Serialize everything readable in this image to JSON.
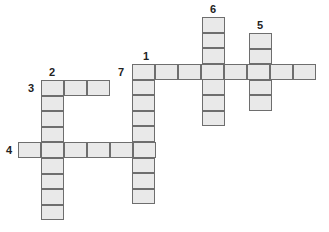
{
  "puzzle": {
    "type": "crossword",
    "cell_fill": "#e9e9e9",
    "cell_border": "#6e6e6e",
    "numbers": [
      {
        "label": "1",
        "x": 143,
        "y": 51
      },
      {
        "label": "2",
        "x": 49,
        "y": 67
      },
      {
        "label": "3",
        "x": 28,
        "y": 83
      },
      {
        "label": "4",
        "x": 6,
        "y": 145
      },
      {
        "label": "5",
        "x": 257,
        "y": 20
      },
      {
        "label": "6",
        "x": 210,
        "y": 4
      },
      {
        "label": "7",
        "x": 118,
        "y": 67
      }
    ],
    "entries": [
      {
        "id": "1-down",
        "direction": "down",
        "length": 9,
        "x": 132,
        "y": 64
      },
      {
        "id": "2-down",
        "direction": "down",
        "length": 9,
        "x": 41,
        "y": 80
      },
      {
        "id": "3-across",
        "direction": "across",
        "length": 3,
        "x": 41,
        "y": 80
      },
      {
        "id": "4-across",
        "direction": "across",
        "length": 6,
        "x": 18,
        "y": 142
      },
      {
        "id": "5-down",
        "direction": "down",
        "length": 5,
        "x": 249,
        "y": 33
      },
      {
        "id": "6-down",
        "direction": "down",
        "length": 7,
        "x": 202,
        "y": 17
      },
      {
        "id": "7-across",
        "direction": "across",
        "length": 8,
        "x": 132,
        "y": 64
      }
    ]
  }
}
